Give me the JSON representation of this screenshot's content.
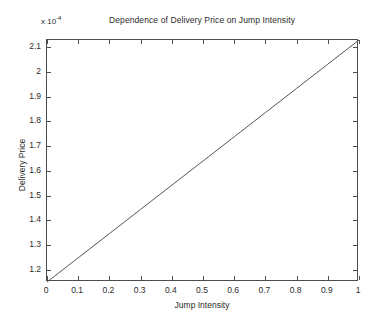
{
  "chart_data": {
    "type": "line",
    "title": "Dependence of Delivery Price on Jump Intensity",
    "xlabel": "Jump Intensity",
    "ylabel": "Delivery Price",
    "y_axis_multiplier": "x 10",
    "y_axis_exponent": "-4",
    "xlim": [
      0,
      1
    ],
    "ylim": [
      1.15,
      2.13
    ],
    "xticks": [
      "0",
      "0.1",
      "0.2",
      "0.3",
      "0.4",
      "0.5",
      "0.6",
      "0.7",
      "0.8",
      "0.9",
      "1"
    ],
    "xtick_values": [
      0,
      0.1,
      0.2,
      0.3,
      0.4,
      0.5,
      0.6,
      0.7,
      0.8,
      0.9,
      1
    ],
    "yticks": [
      "1.2",
      "1.3",
      "1.4",
      "1.5",
      "1.6",
      "1.7",
      "1.8",
      "1.9",
      "2",
      "2.1"
    ],
    "ytick_values": [
      1.2,
      1.3,
      1.4,
      1.5,
      1.6,
      1.7,
      1.8,
      1.9,
      2.0,
      2.1
    ],
    "grid": false,
    "legend": false,
    "line_color": "#555555",
    "series": [
      {
        "name": "Delivery Price",
        "x": [
          0,
          0.1,
          0.2,
          0.3,
          0.4,
          0.5,
          0.6,
          0.7,
          0.8,
          0.9,
          1
        ],
        "values": [
          1.15,
          1.248,
          1.346,
          1.444,
          1.542,
          1.64,
          1.738,
          1.836,
          1.934,
          2.032,
          2.13
        ]
      }
    ]
  }
}
